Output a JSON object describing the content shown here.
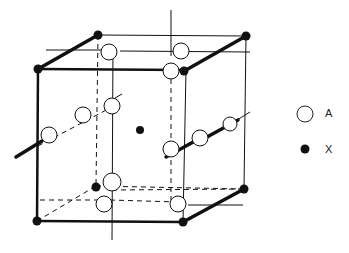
{
  "diagram": {
    "type": "crystal-unit-cell",
    "legend": [
      {
        "symbol": "open-circle",
        "label": "A"
      },
      {
        "symbol": "filled-circle",
        "label": "X"
      }
    ],
    "colors": {
      "line": "#111111",
      "fill_open": "#ffffff",
      "fill_solid": "#111111"
    }
  }
}
